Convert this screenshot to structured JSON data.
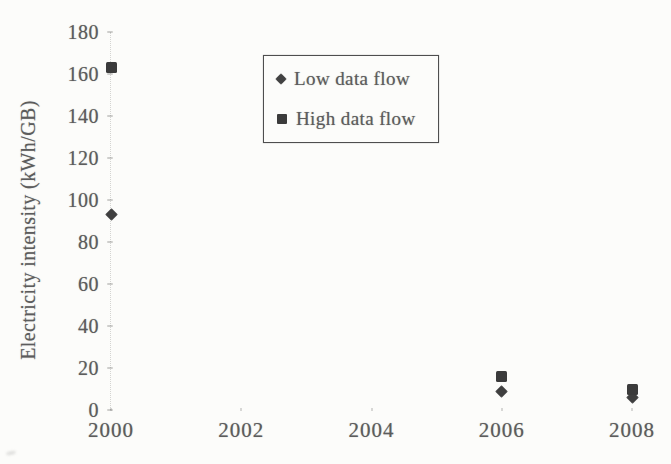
{
  "chart_data": {
    "type": "scatter",
    "title": "",
    "xlabel": "",
    "ylabel": "Electricity intensity (kWh/GB)",
    "xlim": [
      2000,
      2008
    ],
    "ylim": [
      0,
      180
    ],
    "grid": false,
    "legend_position": "inside-top-center-boxed",
    "x_ticks": [
      {
        "value": 2000,
        "label": "2000"
      },
      {
        "value": 2002,
        "label": "2002"
      },
      {
        "value": 2004,
        "label": "2004"
      },
      {
        "value": 2006,
        "label": "2006"
      },
      {
        "value": 2008,
        "label": "2008"
      }
    ],
    "y_ticks": [
      {
        "value": 0,
        "label": "0"
      },
      {
        "value": 20,
        "label": "20"
      },
      {
        "value": 40,
        "label": "40"
      },
      {
        "value": 60,
        "label": "60"
      },
      {
        "value": 80,
        "label": "80"
      },
      {
        "value": 100,
        "label": "100"
      },
      {
        "value": 120,
        "label": "120"
      },
      {
        "value": 140,
        "label": "140"
      },
      {
        "value": 160,
        "label": "160"
      },
      {
        "value": 180,
        "label": "180"
      }
    ],
    "series": [
      {
        "name": "Low data flow",
        "marker": "diamond",
        "color": "#3f3f3f",
        "points": [
          {
            "x": 2000,
            "y": 93
          },
          {
            "x": 2006,
            "y": 9
          },
          {
            "x": 2008,
            "y": 6
          }
        ]
      },
      {
        "name": "High data flow",
        "marker": "square",
        "color": "#3b3b3b",
        "points": [
          {
            "x": 2000,
            "y": 163
          },
          {
            "x": 2006,
            "y": 16
          },
          {
            "x": 2008,
            "y": 10
          }
        ]
      }
    ]
  },
  "colors": {
    "background": "#fcfcfa",
    "text": "#5c5c5c",
    "marker": "#3b3b3b",
    "legend_border": "#4e4e4e",
    "axis_dotted_line": "#a5a5a0"
  }
}
